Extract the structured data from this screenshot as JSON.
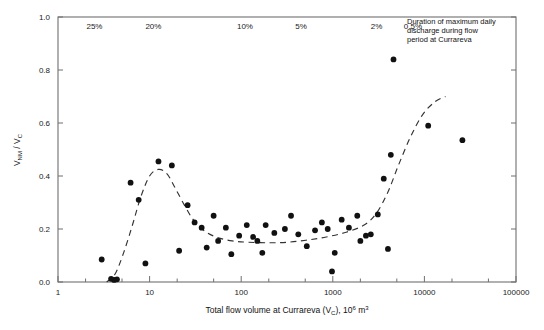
{
  "chart_data": {
    "type": "scatter",
    "title": "",
    "xlabel": "Total flow volume at Currareva (VC), 10^6 m3",
    "xlabel_parts": {
      "pre": "Total flow volume at Currareva (V",
      "sub1": "C",
      "mid": "), 10",
      "sup1": "6",
      "post": " m",
      "sup2": "3"
    },
    "ylabel": "VNM / VC",
    "ylabel_parts": {
      "v1": "V",
      "sub1": "NM",
      "slash": " / V",
      "sub2": "C"
    },
    "xscale": "log",
    "xlim": [
      1,
      100000
    ],
    "ylim": [
      0.0,
      1.0
    ],
    "grid": false,
    "legend": null,
    "xticks": [
      1,
      10,
      100,
      1000,
      10000,
      100000
    ],
    "xtick_labels": [
      "1",
      "10",
      "100",
      "1000",
      "10000",
      "100000"
    ],
    "yticks": [
      0.0,
      0.2,
      0.4,
      0.6,
      0.8,
      1.0
    ],
    "ytick_labels": [
      "0.0",
      "0.2",
      "0.4",
      "0.6",
      "0.8",
      "1.0"
    ],
    "top_percent_labels": [
      {
        "text": "25%",
        "x": 2.5
      },
      {
        "text": "20%",
        "x": 11
      },
      {
        "text": "10%",
        "x": 110
      },
      {
        "text": "5%",
        "x": 450
      },
      {
        "text": "2%",
        "x": 3000
      },
      {
        "text": "0.5%",
        "x": 7500
      }
    ],
    "annotation": {
      "lines": [
        "Duration of maximum daily",
        "discharge during flow",
        "period at Currareva"
      ]
    },
    "points": [
      {
        "x": 3.0,
        "y": 0.085
      },
      {
        "x": 3.8,
        "y": 0.012
      },
      {
        "x": 4.1,
        "y": 0.008
      },
      {
        "x": 4.4,
        "y": 0.01
      },
      {
        "x": 6.2,
        "y": 0.375
      },
      {
        "x": 7.6,
        "y": 0.31
      },
      {
        "x": 9.0,
        "y": 0.07
      },
      {
        "x": 12.5,
        "y": 0.455
      },
      {
        "x": 17.5,
        "y": 0.44
      },
      {
        "x": 21.0,
        "y": 0.118
      },
      {
        "x": 26.0,
        "y": 0.29
      },
      {
        "x": 31.0,
        "y": 0.225
      },
      {
        "x": 37.0,
        "y": 0.205
      },
      {
        "x": 42.0,
        "y": 0.13
      },
      {
        "x": 50.0,
        "y": 0.25
      },
      {
        "x": 56.0,
        "y": 0.155
      },
      {
        "x": 68.0,
        "y": 0.205
      },
      {
        "x": 78.0,
        "y": 0.105
      },
      {
        "x": 95.0,
        "y": 0.175
      },
      {
        "x": 115.0,
        "y": 0.215
      },
      {
        "x": 135.0,
        "y": 0.17
      },
      {
        "x": 150.0,
        "y": 0.155
      },
      {
        "x": 170.0,
        "y": 0.11
      },
      {
        "x": 185.0,
        "y": 0.215
      },
      {
        "x": 230.0,
        "y": 0.185
      },
      {
        "x": 300.0,
        "y": 0.2
      },
      {
        "x": 350.0,
        "y": 0.25
      },
      {
        "x": 420.0,
        "y": 0.18
      },
      {
        "x": 520.0,
        "y": 0.135
      },
      {
        "x": 640.0,
        "y": 0.195
      },
      {
        "x": 760.0,
        "y": 0.225
      },
      {
        "x": 880.0,
        "y": 0.2
      },
      {
        "x": 980.0,
        "y": 0.04
      },
      {
        "x": 1050.0,
        "y": 0.11
      },
      {
        "x": 1250.0,
        "y": 0.235
      },
      {
        "x": 1500.0,
        "y": 0.205
      },
      {
        "x": 1850.0,
        "y": 0.25
      },
      {
        "x": 2000.0,
        "y": 0.155
      },
      {
        "x": 2300.0,
        "y": 0.175
      },
      {
        "x": 2600.0,
        "y": 0.18
      },
      {
        "x": 3100.0,
        "y": 0.255
      },
      {
        "x": 3600.0,
        "y": 0.39
      },
      {
        "x": 4000.0,
        "y": 0.125
      },
      {
        "x": 4300.0,
        "y": 0.48
      },
      {
        "x": 4600.0,
        "y": 0.84
      },
      {
        "x": 11000.0,
        "y": 0.59
      },
      {
        "x": 26000.0,
        "y": 0.535
      }
    ],
    "trend_curve": [
      {
        "x": 3.4,
        "y": 0.0
      },
      {
        "x": 4.2,
        "y": 0.03
      },
      {
        "x": 5.2,
        "y": 0.11
      },
      {
        "x": 6.5,
        "y": 0.215
      },
      {
        "x": 8.0,
        "y": 0.32
      },
      {
        "x": 10.0,
        "y": 0.4
      },
      {
        "x": 12.5,
        "y": 0.425
      },
      {
        "x": 15.5,
        "y": 0.408
      },
      {
        "x": 19.0,
        "y": 0.355
      },
      {
        "x": 24.0,
        "y": 0.29
      },
      {
        "x": 30.0,
        "y": 0.235
      },
      {
        "x": 40.0,
        "y": 0.192
      },
      {
        "x": 55.0,
        "y": 0.168
      },
      {
        "x": 80.0,
        "y": 0.155
      },
      {
        "x": 120.0,
        "y": 0.15
      },
      {
        "x": 200.0,
        "y": 0.148
      },
      {
        "x": 320.0,
        "y": 0.15
      },
      {
        "x": 520.0,
        "y": 0.158
      },
      {
        "x": 850.0,
        "y": 0.17
      },
      {
        "x": 1400.0,
        "y": 0.188
      },
      {
        "x": 2200.0,
        "y": 0.215
      },
      {
        "x": 3000.0,
        "y": 0.26
      },
      {
        "x": 4000.0,
        "y": 0.34
      },
      {
        "x": 5200.0,
        "y": 0.44
      },
      {
        "x": 7000.0,
        "y": 0.545
      },
      {
        "x": 9500.0,
        "y": 0.63
      },
      {
        "x": 13000.0,
        "y": 0.68
      },
      {
        "x": 17000.0,
        "y": 0.7
      }
    ]
  }
}
